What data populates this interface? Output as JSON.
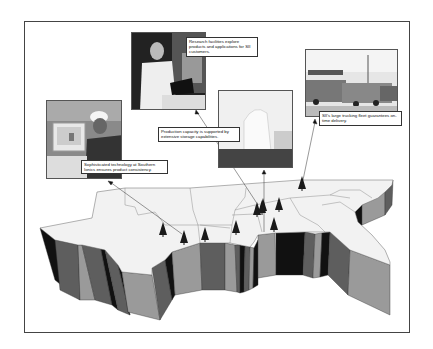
{
  "figure": {
    "captions": {
      "research": "Research facilities explore products and applications for SII customers.",
      "technology": "Sophisticated technology at Southern Ionics ensures product consistency.",
      "storage": "Production capacity is supported by extensive storage capabilities.",
      "trucking": "SII's large trucking fleet guarantees on-time delivery."
    },
    "photos": [
      {
        "name": "research-lab-photo",
        "subject": "scientist in lab coat at equipment"
      },
      {
        "name": "technician-photo",
        "subject": "worker in hard hat at computer"
      },
      {
        "name": "storage-tank-photo",
        "subject": "large white storage tank"
      },
      {
        "name": "truck-fleet-photo",
        "subject": "tanker trucks at loading station"
      }
    ],
    "colors": {
      "map_top": "#f2f2f2",
      "wall_light": "#9a9a9a",
      "wall_mid": "#5e5e5e",
      "wall_dark": "#111111",
      "border": "#444444"
    },
    "facility_markers": 10
  }
}
